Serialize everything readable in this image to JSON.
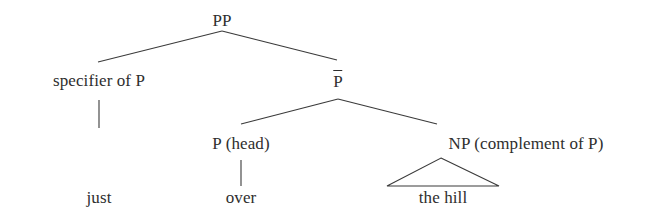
{
  "diagram": {
    "kind": "x-bar-syntax-tree",
    "phrase": "just over the hill",
    "background_color": "#ffffff",
    "line_color": "#3a3a3a",
    "text_color": "#2e2e2e"
  },
  "nodes": {
    "root": {
      "label": "PP",
      "x": 222,
      "y": 20
    },
    "specifier": {
      "label": "specifier of P",
      "x": 99,
      "y": 80
    },
    "pbar": {
      "label": "P",
      "overbar": true,
      "x": 338,
      "y": 82
    },
    "head": {
      "label": "P (head)",
      "x": 241,
      "y": 143
    },
    "complement": {
      "label": "NP (complement of P)",
      "x": 526,
      "y": 143
    }
  },
  "terminals": {
    "specifier_word": {
      "label": "just",
      "x": 99,
      "y": 197
    },
    "head_word": {
      "label": "over",
      "x": 241,
      "y": 197
    },
    "complement_words": {
      "label": "the hill",
      "x": 443,
      "y": 197
    }
  },
  "triangle": {
    "name": "np-abbreviation-triangle",
    "apex_x": 441,
    "apex_y": 158,
    "base_left_x": 387,
    "base_right_x": 499,
    "base_y": 186
  },
  "edges": [
    {
      "name": "pp-to-specifier",
      "from": "PP",
      "to": "specifier of P",
      "x1": 222,
      "y1": 31,
      "x2": 98,
      "y2": 62
    },
    {
      "name": "pp-to-pbar",
      "from": "PP",
      "to": "P-bar",
      "x1": 222,
      "y1": 31,
      "x2": 337,
      "y2": 60
    },
    {
      "name": "specifier-to-just",
      "from": "specifier of P",
      "to": "just",
      "x1": 99,
      "y1": 100,
      "x2": 99,
      "y2": 128
    },
    {
      "name": "pbar-to-head",
      "from": "P-bar",
      "to": "P (head)",
      "x1": 338,
      "y1": 99,
      "x2": 241,
      "y2": 124
    },
    {
      "name": "pbar-to-complement",
      "from": "P-bar",
      "to": "NP (complement of P)",
      "x1": 338,
      "y1": 99,
      "x2": 437,
      "y2": 124
    },
    {
      "name": "head-to-over",
      "from": "P (head)",
      "to": "over",
      "x1": 241,
      "y1": 160,
      "x2": 241,
      "y2": 186
    }
  ]
}
